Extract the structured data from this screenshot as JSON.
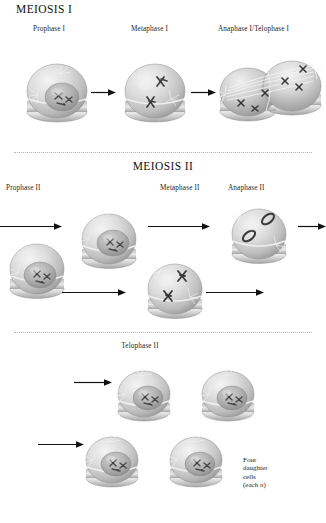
{
  "figure": {
    "title_meiosis_1": "MEIOSIS I",
    "title_meiosis_2": "MEIOSIS II",
    "background_color": "#ffffff",
    "ink_color": "#1d1d1d",
    "cell_fill_light": "#e6e6e6",
    "cell_fill_mid": "#c9c9c9",
    "cell_fill_dark": "#9a9a9a",
    "nucleus_fill": "#b0b0b0",
    "chromosome_color": "#4a4a4a",
    "divider_color": "#b3b3b3"
  },
  "meiosis_one": {
    "heading": "MEIOSIS I",
    "phases": [
      {
        "label": "Prophase I",
        "icon": "cell-prophase-1"
      },
      {
        "label": "Metaphase I",
        "icon": "cell-metaphase-1"
      },
      {
        "label": "Anaphase I/Telophase I",
        "icon": "cell-anaphase-telophase-1"
      }
    ],
    "arrows": [
      {
        "name": "arrow-prophase1-to-metaphase1"
      },
      {
        "name": "arrow-metaphase1-to-anaphase1"
      }
    ]
  },
  "meiosis_two": {
    "heading": "MEIOSIS II",
    "phases": [
      {
        "label": "Prophase II",
        "icon": "cell-prophase-2"
      },
      {
        "label": "Metaphase II",
        "icon": "cell-metaphase-2"
      },
      {
        "label": "Anaphase II",
        "icon": "cell-anaphase-2"
      }
    ],
    "arrows": [
      {
        "name": "arrow-into-prophase2-upper"
      },
      {
        "name": "arrow-into-prophase2-lower"
      },
      {
        "name": "arrow-prophase2-upper-to-anaphase2"
      },
      {
        "name": "arrow-prophase2-lower-to-metaphase2"
      },
      {
        "name": "arrow-anaphase2-upper-out"
      },
      {
        "name": "arrow-metaphase2-lower-out"
      }
    ]
  },
  "telophase_two": {
    "label": "Telophase II",
    "caption_line_1": "Four",
    "caption_line_2": "daughter",
    "caption_line_3": "cells",
    "caption_line_4_prefix": "(each ",
    "caption_line_4_italic": "n",
    "caption_line_4_suffix": ")",
    "arrows": [
      {
        "name": "arrow-into-telophase2-upper"
      },
      {
        "name": "arrow-into-telophase2-lower"
      }
    ],
    "daughter_cells": [
      {
        "name": "daughter-cell-1"
      },
      {
        "name": "daughter-cell-2"
      },
      {
        "name": "daughter-cell-3"
      },
      {
        "name": "daughter-cell-4"
      }
    ]
  }
}
